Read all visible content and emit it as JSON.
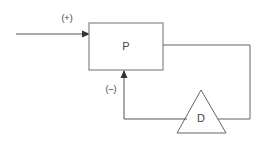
{
  "diagram": {
    "type": "feedback-loop",
    "input": {
      "sign_label": "(+)"
    },
    "blocks": [
      {
        "id": "P",
        "label": "P",
        "shape": "rectangle"
      },
      {
        "id": "D",
        "label": "D",
        "shape": "triangle"
      }
    ],
    "feedback": {
      "sign_label": "(–)"
    },
    "colors": {
      "line": "#555555",
      "box_stroke": "#888888",
      "text": "#444444"
    }
  }
}
